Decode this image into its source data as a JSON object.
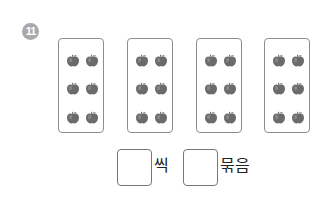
{
  "problem": {
    "number": "11",
    "badge_color": "#a9a9a9"
  },
  "groups": [
    {
      "items": 6,
      "item_icon": "apple-icon"
    },
    {
      "items": 6,
      "item_icon": "apple-icon"
    },
    {
      "items": 6,
      "item_icon": "apple-icon"
    },
    {
      "items": 6,
      "item_icon": "apple-icon"
    }
  ],
  "answer": {
    "per_group_value": "",
    "per_group_unit": "씩",
    "group_count_value": "",
    "group_count_unit": "묶음"
  },
  "colors": {
    "apple": "#6b6b6b",
    "box_border": "#8e8e8e"
  }
}
